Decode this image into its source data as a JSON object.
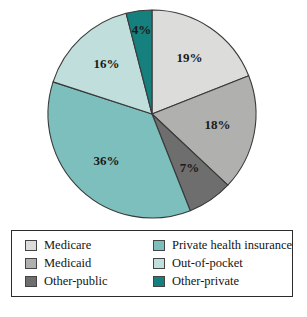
{
  "chart_data": {
    "type": "pie",
    "title": "",
    "subtitle": "",
    "xlabel": "",
    "ylabel": "",
    "grid": false,
    "legend_position": "bottom",
    "start_angle_deg": 0,
    "direction": "clockwise",
    "units": "percent",
    "categories": [
      "Medicare",
      "Medicaid",
      "Other-public",
      "Private health insurance",
      "Out-of-pocket",
      "Other-private"
    ],
    "values": [
      19,
      18,
      7,
      36,
      16,
      4
    ],
    "labels": [
      "19%",
      "18%",
      "7%",
      "36%",
      "16%",
      "4%"
    ],
    "colors": [
      "#dcdcda",
      "#b0b0ae",
      "#6e6e6e",
      "#7cbfbd",
      "#bfdedc",
      "#15807d"
    ],
    "slice_outline_color": "#3a3a3a",
    "slices": [
      {
        "name": "Medicare",
        "value": 19,
        "label": "19%",
        "color": "#dcdcda"
      },
      {
        "name": "Medicaid",
        "value": 18,
        "label": "18%",
        "color": "#b0b0ae"
      },
      {
        "name": "Other-public",
        "value": 7,
        "label": "7%",
        "color": "#6e6e6e"
      },
      {
        "name": "Private health insurance",
        "value": 36,
        "label": "36%",
        "color": "#7cbfbd"
      },
      {
        "name": "Out-of-pocket",
        "value": 16,
        "label": "16%",
        "color": "#bfdedc"
      },
      {
        "name": "Other-private",
        "value": 4,
        "label": "4%",
        "color": "#15807d"
      }
    ]
  },
  "legend": {
    "border_color": "#2b2b2b",
    "columns": 2,
    "entries": [
      {
        "label": "Medicare",
        "color": "#dcdcda"
      },
      {
        "label": "Private health insurance",
        "color": "#7cbfbd"
      },
      {
        "label": "Medicaid",
        "color": "#b0b0ae"
      },
      {
        "label": "Out-of-pocket",
        "color": "#bfdedc"
      },
      {
        "label": "Other-public",
        "color": "#6e6e6e"
      },
      {
        "label": "Other-private",
        "color": "#15807d"
      }
    ]
  }
}
